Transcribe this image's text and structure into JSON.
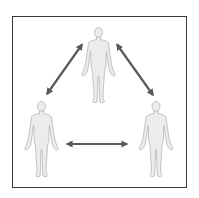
{
  "diagram": {
    "type": "relationship-triangle",
    "nodes": [
      {
        "id": "person-top",
        "label": "",
        "position": "top-center"
      },
      {
        "id": "person-bottom-left",
        "label": "",
        "position": "bottom-left"
      },
      {
        "id": "person-bottom-right",
        "label": "",
        "position": "bottom-right"
      }
    ],
    "edges": [
      {
        "from": "person-top",
        "to": "person-bottom-left",
        "direction": "bidirectional"
      },
      {
        "from": "person-top",
        "to": "person-bottom-right",
        "direction": "bidirectional"
      },
      {
        "from": "person-bottom-left",
        "to": "person-bottom-right",
        "direction": "bidirectional"
      }
    ],
    "colors": {
      "frame": "#3a3a3a",
      "arrow": "#5a5a5a",
      "figure_fill": "#ececec",
      "figure_stroke": "#b5b5b5",
      "background": "#ffffff"
    }
  }
}
